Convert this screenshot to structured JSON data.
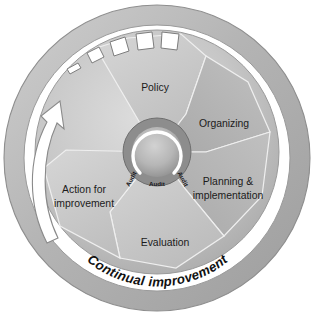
{
  "diagram": {
    "type": "cyclic-wheel-diagram",
    "ring_label": "Continual improvement",
    "hub": {
      "labels": [
        "Audit",
        "Audit",
        "Audit"
      ],
      "arc_icon": "circular-arrow-icon"
    },
    "arrow": {
      "name": "continual-improvement-arrow",
      "direction": "counter-clockwise-upward"
    },
    "teeth": {
      "name": "ratchet-teeth",
      "count": 5
    },
    "segments": [
      {
        "id": "policy",
        "label": "Policy",
        "lines": [
          "Policy"
        ]
      },
      {
        "id": "organizing",
        "label": "Organizing",
        "lines": [
          "Organizing"
        ]
      },
      {
        "id": "planning-implementation",
        "label": "Planning & implementation",
        "lines": [
          "Planning &",
          "implementation"
        ]
      },
      {
        "id": "evaluation",
        "label": "Evaluation",
        "lines": [
          "Evaluation"
        ]
      },
      {
        "id": "action-for-improvement",
        "label": "Action for improvement",
        "lines": [
          "Action for",
          "improvement"
        ]
      }
    ],
    "colors": {
      "background": "#ffffff",
      "outer_ring": "#b7b7b7",
      "outer_ring_edge": "#8e8e8e",
      "gap_ring": "#ffffff",
      "disc": "#c9c9c9",
      "disc_edge": "#9a9a9a",
      "segment_fill": "#c9c9c9",
      "segment_fill_dark": "#b0b0b0",
      "hub_ring": "#8d8d8d",
      "hub_center": "#bdbdbd",
      "arrow_fill": "#ffffff",
      "arrow_stroke": "#8a8a8a",
      "tooth_fill": "#ffffff",
      "tooth_stroke": "#7d7d7d",
      "text": "#1b1b1b"
    }
  }
}
